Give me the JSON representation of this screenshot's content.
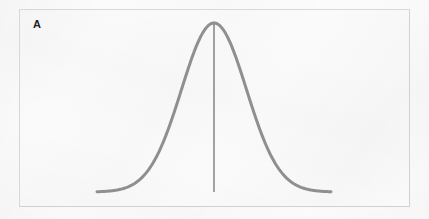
{
  "figure": {
    "panel_label": "A",
    "caption": "",
    "background_color": "#fafafa",
    "border_color": "#d6d8d9",
    "outer_background_color": "#fcfcfc"
  },
  "chart_data": {
    "type": "line",
    "title": "",
    "subtitle": "",
    "xlabel": "",
    "ylabel": "",
    "grid": false,
    "legend": null,
    "axes_visible": false,
    "tick_labels_x": [],
    "tick_labels_y": [],
    "xlim": [
      -3.6,
      3.6
    ],
    "ylim": [
      0,
      1
    ],
    "series": [
      {
        "name": "normal-distribution-curve",
        "kind": "gaussian",
        "mean": 0,
        "sd": 1,
        "color": "#8a8a8a",
        "line_width": 3,
        "x": [
          -3.6,
          -3.3,
          -3.0,
          -2.7,
          -2.4,
          -2.1,
          -1.8,
          -1.5,
          -1.2,
          -0.9,
          -0.6,
          -0.3,
          0.0,
          0.3,
          0.6,
          0.9,
          1.2,
          1.5,
          1.8,
          2.1,
          2.4,
          2.7,
          3.0,
          3.3,
          3.6
        ],
        "y": [
          0.0015,
          0.0043,
          0.0111,
          0.0264,
          0.0561,
          0.1075,
          0.1979,
          0.3247,
          0.4868,
          0.667,
          0.8353,
          0.956,
          1.0,
          0.956,
          0.8353,
          0.667,
          0.4868,
          0.3247,
          0.1979,
          0.1075,
          0.0561,
          0.0264,
          0.0111,
          0.0043,
          0.0015
        ]
      }
    ],
    "annotations": [
      {
        "name": "mean-vertical-line",
        "kind": "vline",
        "x": 0,
        "y_from": 0,
        "y_to": 1.0,
        "color": "#5a5a5a",
        "line_width": 1
      }
    ]
  }
}
